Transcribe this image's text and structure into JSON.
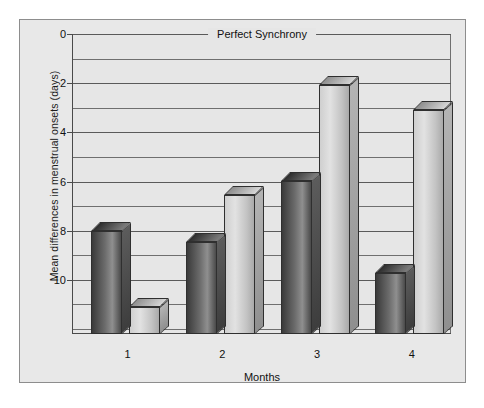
{
  "figure": {
    "background_color": "#e8e8e8",
    "border_color": "#8d8d8d"
  },
  "chart_data": {
    "type": "bar",
    "title": "Perfect Synchrony",
    "xlabel": "Months",
    "ylabel": "Mean differences in menstrual onsets (days)",
    "categories": [
      "1",
      "2",
      "3",
      "4"
    ],
    "series": [
      {
        "name": "series-a",
        "color": "#5a5a5a",
        "values": [
          8.0,
          8.45,
          5.98,
          9.7
        ]
      },
      {
        "name": "series-b",
        "color": "#c9c9c9",
        "values": [
          11.1,
          6.55,
          2.07,
          3.1
        ]
      }
    ],
    "ylim": [
      0,
      12.2
    ],
    "y_inverted": true,
    "yticks": [
      "0",
      "2",
      "4",
      "6",
      "8",
      "10"
    ],
    "ytick_values": [
      0,
      2,
      4,
      6,
      8,
      10
    ],
    "gridline_interval": 1,
    "grid": true,
    "legend": "none",
    "annotations": [
      "Perfect Synchrony"
    ]
  }
}
